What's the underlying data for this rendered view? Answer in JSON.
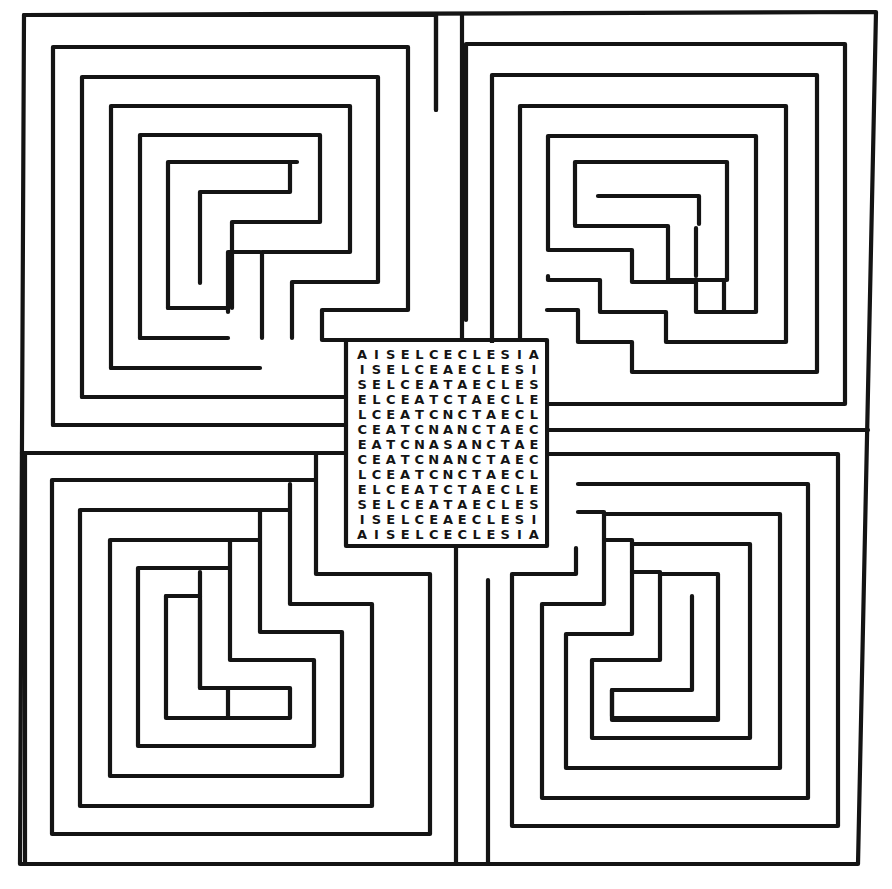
{
  "figure": {
    "line_color": "#141414",
    "background_color": "#ffffff"
  },
  "center_grid": {
    "rows": [
      "AISELCECLESIA",
      "ISELCEAECLESI",
      "SELCEATAECLES",
      "ELCEATCTAECLE",
      "LCEATCNCTAECL",
      "CEATCNANCTAEC",
      "EATCNASANCTAE",
      "CEATCNANCTAEC",
      "LCEATCNCTAECL",
      "ELCEATCTAECLE",
      "SELCEATAECLES",
      "ISELCEAECLESI",
      "AISELCECLESIA"
    ],
    "center_letter": "S",
    "phrase": "SANCTA ECCLESIA"
  },
  "maze": {
    "quadrants": [
      "top-left",
      "top-right",
      "bottom-left",
      "bottom-right"
    ],
    "entrance": "bottom-center"
  }
}
